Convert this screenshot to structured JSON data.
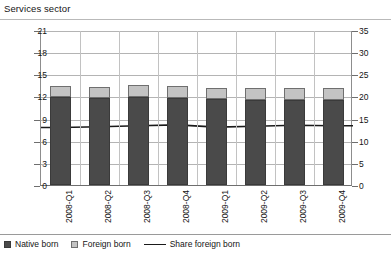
{
  "chart_title": "Services sector",
  "legend": {
    "native_label": "Native born",
    "foreign_label": "Foreign born",
    "share_label": "Share foreign born",
    "native_swatch_icon": "dark-square-swatch-icon",
    "foreign_swatch_icon": "light-square-swatch-icon",
    "share_swatch_icon": "line-swatch-icon"
  },
  "colors": {
    "native": "#4a4a4a",
    "foreign": "#c3c3c3",
    "line": "#1a1a1a",
    "grid": "#b4b4b4",
    "axis": "#6e6e6e"
  },
  "chart_data": {
    "type": "bar",
    "title": "Services sector",
    "xlabel": "",
    "ylabel": "",
    "grid": true,
    "legend_position": "bottom",
    "categories": [
      "2008-Q1",
      "2008-Q2",
      "2008-Q3",
      "2008-Q4",
      "2009-Q1",
      "2009-Q2",
      "2009-Q3",
      "2009-Q4"
    ],
    "left_axis": {
      "ticks": [
        0,
        3,
        6,
        9,
        12,
        15,
        18,
        21
      ],
      "ylim": [
        0,
        21
      ],
      "applies_to": [
        "Native born",
        "Foreign born"
      ]
    },
    "right_axis": {
      "ticks": [
        0,
        5,
        10,
        15,
        20,
        25,
        30,
        35
      ],
      "ylim": [
        0,
        35
      ],
      "applies_to": [
        "Share foreign born"
      ]
    },
    "stacked": true,
    "series": [
      {
        "name": "Native born",
        "axis": "left",
        "values": [
          11.9,
          11.8,
          11.9,
          11.8,
          11.6,
          11.5,
          11.5,
          11.5
        ]
      },
      {
        "name": "Foreign born",
        "axis": "left",
        "values": [
          1.5,
          1.5,
          1.6,
          1.6,
          1.6,
          1.6,
          1.7,
          1.7
        ]
      },
      {
        "name": "Share foreign born",
        "axis": "right",
        "type": "line",
        "values": [
          13.2,
          13.4,
          13.6,
          13.8,
          13.3,
          13.5,
          13.7,
          13.6
        ]
      }
    ]
  }
}
